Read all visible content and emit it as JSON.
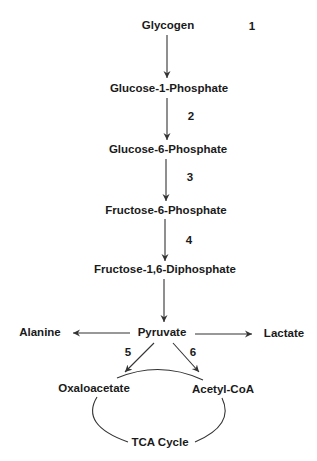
{
  "colors": {
    "text": "#1a1a1a",
    "line": "#333333",
    "background": "#ffffff"
  },
  "nodes": {
    "glycogen": "Glycogen",
    "glucose_1_phosphate": "Glucose-1-Phosphate",
    "glucose_6_phosphate": "Glucose-6-Phosphate",
    "fructose_6_phosphate": "Fructose-6-Phosphate",
    "fructose_1_6_diphosphate": "Fructose-1,6-Diphosphate",
    "pyruvate": "Pyruvate",
    "alanine": "Alanine",
    "lactate": "Lactate",
    "oxaloacetate": "Oxaloacetate",
    "acetyl_coa": "Acetyl-CoA",
    "tca_cycle": "TCA Cycle"
  },
  "step_numbers": {
    "s1": "1",
    "s2": "2",
    "s3": "3",
    "s4": "4",
    "s5": "5",
    "s6": "6"
  },
  "edges": [
    {
      "from": "Glycogen",
      "to": "Glucose-1-Phosphate"
    },
    {
      "from": "Glucose-1-Phosphate",
      "to": "Glucose-6-Phosphate",
      "step": "2"
    },
    {
      "from": "Glucose-6-Phosphate",
      "to": "Fructose-6-Phosphate",
      "step": "3"
    },
    {
      "from": "Fructose-6-Phosphate",
      "to": "Fructose-1,6-Diphosphate",
      "step": "4"
    },
    {
      "from": "Fructose-1,6-Diphosphate",
      "to": "Pyruvate"
    },
    {
      "from": "Pyruvate",
      "to": "Alanine"
    },
    {
      "from": "Pyruvate",
      "to": "Lactate"
    },
    {
      "from": "Pyruvate",
      "to": "Oxaloacetate",
      "step": "5"
    },
    {
      "from": "Pyruvate",
      "to": "Acetyl-CoA",
      "step": "6"
    },
    {
      "from": "Oxaloacetate",
      "to": "TCA Cycle",
      "type": "cycle"
    },
    {
      "from": "Acetyl-CoA",
      "to": "TCA Cycle",
      "type": "cycle"
    }
  ]
}
